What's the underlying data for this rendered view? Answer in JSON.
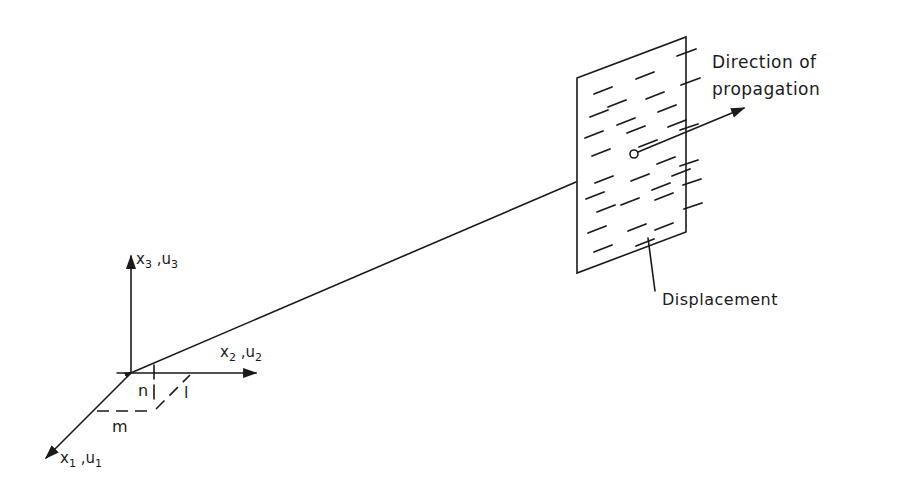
{
  "diagram": {
    "type": "plane-wave-propagation",
    "axes": {
      "x1": {
        "label_var": "x",
        "label_sub": "1",
        "label_var2": "u",
        "label_sub2": "1"
      },
      "x2": {
        "label_var": "x",
        "label_sub": "2",
        "label_var2": "u",
        "label_sub2": "2"
      },
      "x3": {
        "label_var": "x",
        "label_sub": "3",
        "label_var2": "u",
        "label_sub2": "3"
      }
    },
    "direction_cosines": {
      "l": "l",
      "m": "m",
      "n": "n"
    },
    "labels": {
      "direction_line1": "Direction of",
      "direction_line2": "propagation",
      "displacement": "Displacement"
    },
    "colors": {
      "ink": "#1a1a1a",
      "background": "#ffffff"
    }
  }
}
